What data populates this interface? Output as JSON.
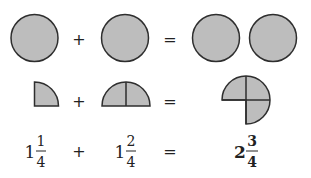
{
  "diagram": {
    "colors": {
      "fill": "#bdbdbd",
      "stroke": "#2e2e2e",
      "text": "#222222"
    },
    "rows": {
      "wholes": {
        "left": {
          "shape": "full-circle",
          "count": 1
        },
        "operator": "+",
        "right": {
          "shape": "full-circle",
          "count": 1
        },
        "equals": "=",
        "result": {
          "shape": "full-circle",
          "count": 2
        }
      },
      "fractions": {
        "left": {
          "shape": "quarter-circle",
          "quarters": 1
        },
        "operator": "+",
        "right": {
          "shape": "half-circle-divided",
          "quarters": 2
        },
        "equals": "=",
        "result": {
          "shape": "three-quarter-circle",
          "quarters": 3
        }
      },
      "numbers": {
        "left": {
          "whole": "1",
          "numerator": "1",
          "denominator": "4"
        },
        "operator": "+",
        "right": {
          "whole": "1",
          "numerator": "2",
          "denominator": "4"
        },
        "equals": "=",
        "result": {
          "whole": "2",
          "numerator": "3",
          "denominator": "4",
          "bold": true
        }
      }
    }
  }
}
